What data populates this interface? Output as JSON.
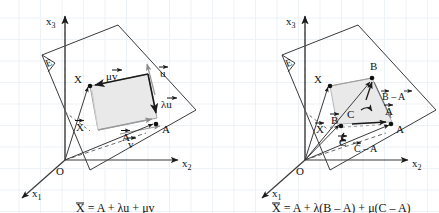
{
  "figure": {
    "background": "#ffffff",
    "grid_color": "#dfe9f2",
    "ink_color": "#1a1a1a",
    "plane_fill": "#e8e8e8",
    "plane_stroke": "#333333"
  },
  "left_diagram": {
    "name": "plane-by-point-and-two-direction-vectors",
    "axes": {
      "x1": "x",
      "x1_sub": "1",
      "x2": "x",
      "x2_sub": "2",
      "x3": "x",
      "x3_sub": "3"
    },
    "origin": "O",
    "plane_label": "E",
    "points": [
      {
        "id": "X",
        "label": "X"
      },
      {
        "id": "A",
        "label": "A"
      }
    ],
    "vectors": [
      {
        "id": "X-pos",
        "label": "X",
        "accent": "arrow"
      },
      {
        "id": "A-pos",
        "label": "A",
        "accent": "arrow"
      },
      {
        "id": "u",
        "label": "u",
        "accent": "arrow"
      },
      {
        "id": "v",
        "label": "v",
        "accent": "arrow"
      },
      {
        "id": "lambda-u",
        "label": "λu",
        "accent": "arrow"
      },
      {
        "id": "mu-v",
        "label": "μv",
        "accent": "arrow"
      }
    ],
    "equation": {
      "lhs": "X",
      "text": "X = A + λu + μv",
      "terms": [
        "X",
        "=",
        "A",
        "+",
        "λ",
        "u",
        "+",
        "μ",
        "v"
      ]
    }
  },
  "right_diagram": {
    "name": "plane-by-three-points",
    "axes": {
      "x1": "x",
      "x1_sub": "1",
      "x2": "x",
      "x2_sub": "2",
      "x3": "x",
      "x3_sub": "3"
    },
    "origin": "O",
    "plane_label": "E",
    "points": [
      {
        "id": "X",
        "label": "X"
      },
      {
        "id": "A",
        "label": "A"
      },
      {
        "id": "B",
        "label": "B"
      },
      {
        "id": "C",
        "label": "C"
      }
    ],
    "vectors": [
      {
        "id": "X-pos",
        "label": "X",
        "accent": "arrow"
      },
      {
        "id": "A-pos",
        "label": "A",
        "accent": "arrow"
      },
      {
        "id": "B-pos",
        "label": "B",
        "accent": "arrow"
      },
      {
        "id": "C-pos",
        "label": "C",
        "accent": "arrow"
      },
      {
        "id": "B-minus-A",
        "label": "B – A",
        "accent": "arrow"
      },
      {
        "id": "C-minus-A",
        "label": "C – A",
        "accent": "arrow"
      }
    ],
    "equation": {
      "lhs": "X",
      "text": "X = A + λ(B – A) + μ(C – A)",
      "terms": [
        "X",
        "=",
        "A",
        "+",
        "λ",
        "(",
        "B",
        "–",
        "A",
        ")",
        "+",
        "μ",
        "(",
        "C",
        "–",
        "A",
        ")"
      ]
    }
  }
}
